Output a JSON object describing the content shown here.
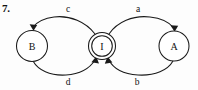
{
  "figure": {
    "number_label": "7.",
    "type": "state-transition-diagram",
    "background_color": "#fdfdfd",
    "stroke_color": "#1a1a1a",
    "text_color": "#111111"
  },
  "nodes": [
    {
      "id": "B",
      "label": "B",
      "shape": "circle",
      "accepting": false,
      "cx": 32,
      "cy": 46,
      "r": 15.5
    },
    {
      "id": "I",
      "label": "I",
      "shape": "double-circle",
      "accepting": true,
      "cx": 102,
      "cy": 46,
      "r": 13.5,
      "r_inner": 10.5
    },
    {
      "id": "A",
      "label": "A",
      "shape": "circle",
      "accepting": false,
      "cx": 174,
      "cy": 46,
      "r": 15.0
    }
  ],
  "edges": [
    {
      "id": "edge-c",
      "label": "c",
      "from": "I",
      "to": "B",
      "label_x": 68,
      "label_y": 12,
      "side": "top-left",
      "arrow_target": "B-top"
    },
    {
      "id": "edge-a",
      "label": "a",
      "from": "I",
      "to": "A",
      "label_x": 138,
      "label_y": 12,
      "side": "top-right",
      "arrow_target": "A-top"
    },
    {
      "id": "edge-d",
      "label": "d",
      "from": "B",
      "to": "I",
      "label_x": 68,
      "label_y": 85,
      "side": "bottom-left",
      "arrow_target": "I-bottom-left"
    },
    {
      "id": "edge-b",
      "label": "b",
      "from": "A",
      "to": "I",
      "label_x": 137,
      "label_y": 85,
      "side": "bottom-right",
      "arrow_target": "I-bottom-right"
    }
  ]
}
